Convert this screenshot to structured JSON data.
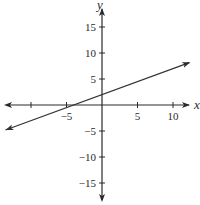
{
  "chart_data": {
    "type": "line",
    "title": "",
    "xlabel": "x",
    "ylabel": "y",
    "xlim": [
      -14,
      13
    ],
    "ylim": [
      -18,
      19
    ],
    "grid": false,
    "legend": null,
    "x_ticks": [
      -10,
      -5,
      0,
      5,
      10
    ],
    "x_tick_labels": [
      "",
      "−5",
      "",
      "5",
      "10"
    ],
    "y_ticks": [
      -15,
      -10,
      -5,
      0,
      5,
      10,
      15
    ],
    "y_tick_labels": [
      "−15",
      "−10",
      "−5",
      "",
      "5",
      "10",
      "15"
    ],
    "series": [
      {
        "name": "line",
        "equation": "y = 0.5x + 2",
        "slope": 0.5,
        "intercept": 2,
        "x": [
          -13.6,
          12.3
        ],
        "y": [
          -4.8,
          8.15
        ],
        "arrows": "both"
      }
    ],
    "axis_arrows": true
  },
  "colors": {
    "axis": "#2a2a2a",
    "line": "#333333",
    "background": "#ffffff"
  }
}
